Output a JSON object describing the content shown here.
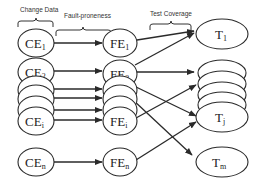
{
  "headers": {
    "change_data": "Change Data",
    "fault_proneness": "Fault-proneness",
    "test_coverage": "Test Coverage"
  },
  "nodes": {
    "ce": [
      {
        "id": "CE1",
        "base": "CE",
        "sub": "1"
      },
      {
        "id": "CE2",
        "base": "CE",
        "sub": "2"
      },
      {
        "id": "CEi",
        "base": "CE",
        "sub": "i"
      },
      {
        "id": "CEn",
        "base": "CE",
        "sub": "n"
      }
    ],
    "fe": [
      {
        "id": "FE1",
        "base": "FE",
        "sub": "1"
      },
      {
        "id": "FE2",
        "base": "FE",
        "sub": "2"
      },
      {
        "id": "FEi",
        "base": "FE",
        "sub": "i"
      },
      {
        "id": "FEn",
        "base": "FE",
        "sub": "n"
      }
    ],
    "t": [
      {
        "id": "T1",
        "base": "T",
        "sub": "1"
      },
      {
        "id": "Tj",
        "base": "T",
        "sub": "j"
      },
      {
        "id": "Tm",
        "base": "T",
        "sub": "m"
      }
    ]
  },
  "edges": [
    {
      "from": "CE1",
      "to": "FE1"
    },
    {
      "from": "CE2",
      "to": "FE2"
    },
    {
      "from": "CE_stack_a",
      "to": "FE_stack_a"
    },
    {
      "from": "CE_stack_b",
      "to": "FE_stack_b"
    },
    {
      "from": "CE_stack_c",
      "to": "FE_stack_c"
    },
    {
      "from": "CEi",
      "to": "FEi"
    },
    {
      "from": "CEn",
      "to": "FEn"
    },
    {
      "from": "FE1",
      "to": "T1"
    },
    {
      "from": "FE2",
      "to": "T1"
    },
    {
      "from": "FE2",
      "to": "T_stack"
    },
    {
      "from": "FE_stack",
      "to": "Tj"
    },
    {
      "from": "FEi",
      "to": "T_stack"
    },
    {
      "from": "FE_stack",
      "to": "Tm"
    },
    {
      "from": "FEn",
      "to": "Tj"
    }
  ],
  "colors": {
    "stroke": "#2a2a2a",
    "background": "#ffffff"
  }
}
